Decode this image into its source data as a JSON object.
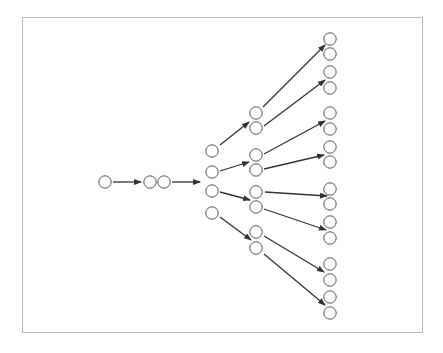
{
  "diagram": {
    "type": "branching-tree",
    "node_radius": 6.2,
    "colors": {
      "node_stroke": "#555555",
      "node_fill": "#ffffff",
      "edge": "#333333",
      "frame": "#b8b8b8"
    },
    "nodes": [
      {
        "id": "n0",
        "x": 105,
        "y": 182
      },
      {
        "id": "n1a",
        "x": 150,
        "y": 182
      },
      {
        "id": "n1b",
        "x": 164,
        "y": 182
      },
      {
        "id": "n2a",
        "x": 212,
        "y": 151
      },
      {
        "id": "n2b",
        "x": 212,
        "y": 172
      },
      {
        "id": "n2c",
        "x": 212,
        "y": 191
      },
      {
        "id": "n2d",
        "x": 212,
        "y": 213
      },
      {
        "id": "n3a",
        "x": 256,
        "y": 113
      },
      {
        "id": "n3b",
        "x": 256,
        "y": 128
      },
      {
        "id": "n3c",
        "x": 256,
        "y": 155
      },
      {
        "id": "n3d",
        "x": 256,
        "y": 170
      },
      {
        "id": "n3e",
        "x": 256,
        "y": 192
      },
      {
        "id": "n3f",
        "x": 256,
        "y": 207
      },
      {
        "id": "n3g",
        "x": 256,
        "y": 232
      },
      {
        "id": "n3h",
        "x": 256,
        "y": 248
      },
      {
        "id": "n4a",
        "x": 330,
        "y": 39
      },
      {
        "id": "n4b",
        "x": 330,
        "y": 54
      },
      {
        "id": "n4c",
        "x": 330,
        "y": 72
      },
      {
        "id": "n4d",
        "x": 330,
        "y": 88
      },
      {
        "id": "n4e",
        "x": 330,
        "y": 113
      },
      {
        "id": "n4f",
        "x": 330,
        "y": 129
      },
      {
        "id": "n4g",
        "x": 330,
        "y": 147
      },
      {
        "id": "n4h",
        "x": 330,
        "y": 162
      },
      {
        "id": "n4i",
        "x": 330,
        "y": 189
      },
      {
        "id": "n4j",
        "x": 330,
        "y": 204
      },
      {
        "id": "n4k",
        "x": 330,
        "y": 222
      },
      {
        "id": "n4l",
        "x": 330,
        "y": 238
      },
      {
        "id": "n4m",
        "x": 330,
        "y": 264
      },
      {
        "id": "n4n",
        "x": 330,
        "y": 280
      },
      {
        "id": "n4o",
        "x": 330,
        "y": 297
      },
      {
        "id": "n4p",
        "x": 330,
        "y": 313
      }
    ],
    "edges": [
      {
        "x1": 113,
        "y1": 182,
        "x2": 141,
        "y2": 182
      },
      {
        "x1": 172,
        "y1": 182,
        "x2": 200,
        "y2": 182
      },
      {
        "x1": 220,
        "y1": 145,
        "x2": 249,
        "y2": 122
      },
      {
        "x1": 220,
        "y1": 171,
        "x2": 249,
        "y2": 162
      },
      {
        "x1": 220,
        "y1": 192,
        "x2": 250,
        "y2": 200
      },
      {
        "x1": 220,
        "y1": 217,
        "x2": 251,
        "y2": 240
      },
      {
        "x1": 263,
        "y1": 107,
        "x2": 325,
        "y2": 45
      },
      {
        "x1": 264,
        "y1": 126,
        "x2": 325,
        "y2": 80
      },
      {
        "x1": 264,
        "y1": 154,
        "x2": 325,
        "y2": 121
      },
      {
        "x1": 264,
        "y1": 169,
        "x2": 324,
        "y2": 155
      },
      {
        "x1": 265,
        "y1": 192,
        "x2": 327,
        "y2": 196
      },
      {
        "x1": 264,
        "y1": 209,
        "x2": 326,
        "y2": 230
      },
      {
        "x1": 264,
        "y1": 236,
        "x2": 324,
        "y2": 272
      },
      {
        "x1": 264,
        "y1": 254,
        "x2": 325,
        "y2": 305
      }
    ]
  }
}
